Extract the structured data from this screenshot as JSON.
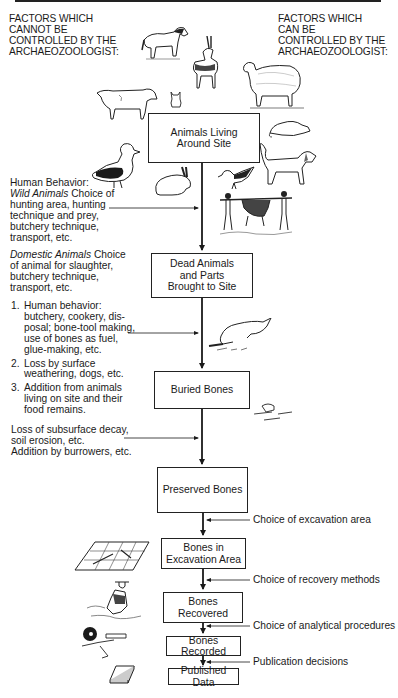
{
  "headers": {
    "left": "FACTORS WHICH\nCANNOT BE\nCONTROLLED BY THE\nARCHAEOZOOLOGIST:",
    "right": "FACTORS WHICH\nCAN BE\nCONTROLLED BY THE\nARCHAEOZOOLOGIST:"
  },
  "boxes": [
    {
      "label": "Animals Living\nAround Site"
    },
    {
      "label": "Dead Animals\nand Parts\nBrought to Site"
    },
    {
      "label": "Buried Bones"
    },
    {
      "label": "Preserved Bones"
    },
    {
      "label": "Bones in\nExcavation Area"
    },
    {
      "label": "Bones Recovered"
    },
    {
      "label": "Bones Recorded"
    },
    {
      "label": "Published Data"
    }
  ],
  "left_notes": {
    "human_behavior_title": "Human Behavior:",
    "wild_label": "Wild Animals",
    "wild_text": " Choice of\nhunting area, hunting\ntechnique and prey,\nbutchery technique,\ntransport, etc.",
    "domestic_label": "Domestic Animals",
    "domestic_text": " Choice\nof animal for slaughter,\nbutchery technique,\ntransport, etc.",
    "site_factors": [
      {
        "num": "1.",
        "text": "Human behavior:\nbutchery, cookery, dis-\nposal; bone-tool making,\nuse of bones as fuel,\nglue-making, etc."
      },
      {
        "num": "2.",
        "text": "Loss by surface\nweathering, dogs, etc."
      },
      {
        "num": "3.",
        "text": "Addition from animals\nliving on site and their\nfood remains."
      }
    ],
    "burial_factors": "Loss of subsurface decay,\nsoil erosion, etc.\nAddition by burrowers, etc."
  },
  "right_notes": [
    {
      "label": "Choice of excavation area"
    },
    {
      "label": "Choice of recovery methods"
    },
    {
      "label": "Choice of analytical procedures"
    },
    {
      "label": "Publication decisions"
    }
  ],
  "illustrations": [
    {
      "icon": "horse-icon"
    },
    {
      "icon": "antelope-icon"
    },
    {
      "icon": "sheep-icon"
    },
    {
      "icon": "goat-icon"
    },
    {
      "icon": "cat-icon"
    },
    {
      "icon": "rat-icon"
    },
    {
      "icon": "duck-icon"
    },
    {
      "icon": "rabbit-icon"
    },
    {
      "icon": "bird-icon"
    },
    {
      "icon": "dog-icon"
    },
    {
      "icon": "hunters-carrying-animal-icon"
    },
    {
      "icon": "dog-chewing-bone-icon"
    },
    {
      "icon": "burrowing-animal-bones-icon"
    },
    {
      "icon": "excavation-grid-icon"
    },
    {
      "icon": "excavator-icon"
    },
    {
      "icon": "analyst-icon"
    },
    {
      "icon": "book-icon"
    }
  ],
  "colors": {
    "ink": "#1a1a1a",
    "background": "#ffffff"
  }
}
